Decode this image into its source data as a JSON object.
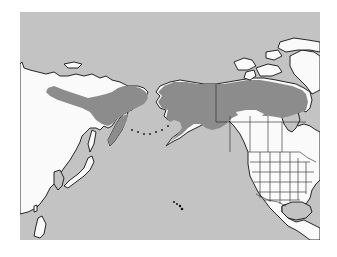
{
  "map": {
    "type": "species-range-map",
    "region": "North Pacific: northeast Asia, Alaska, Canada, USA, Mexico",
    "colors": {
      "ocean": "#c3c3c3",
      "land": "#fafafa",
      "range": "#8c8c8c",
      "outline": "#111111",
      "page_background": "#ffffff"
    },
    "layers": [
      {
        "name": "range",
        "label": "Species range",
        "areas": [
          "Northeastern Siberia",
          "Kamchatka",
          "Alaska",
          "Yukon",
          "Northwest Territories",
          "Nunavut mainland",
          "Northern British Columbia"
        ]
      },
      {
        "name": "land",
        "label": "Land"
      },
      {
        "name": "ocean",
        "label": "Ocean"
      }
    ]
  }
}
